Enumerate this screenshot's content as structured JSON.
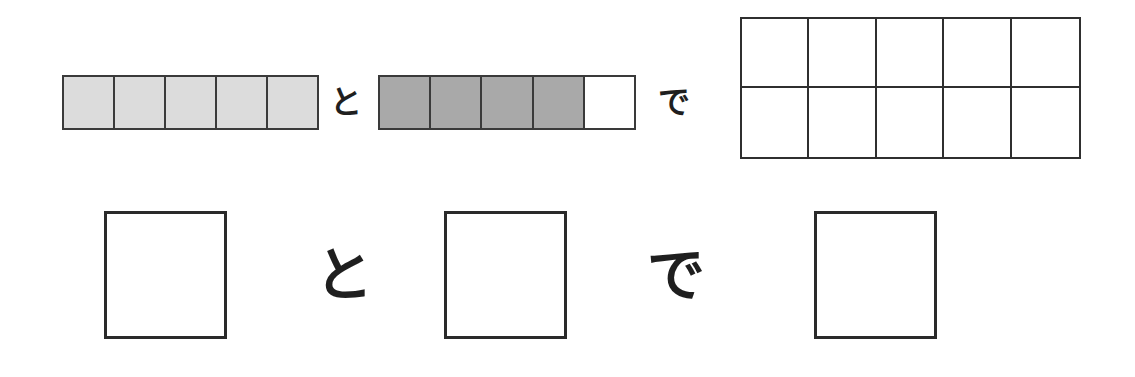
{
  "problem": {
    "bar_a": {
      "cells": 5,
      "filled": 5,
      "fill_color": "#dcdcdc"
    },
    "connector_to": "と",
    "bar_b": {
      "cells": 5,
      "filled": 4,
      "fill_color": "#a9a9a9",
      "empty_color": "#ffffff"
    },
    "connector_de": "で",
    "ten_frame": {
      "rows": 2,
      "cols": 5,
      "filled": 0
    }
  },
  "answer_row": {
    "box_1": "",
    "connector_to": "と",
    "box_2": "",
    "connector_de": "で",
    "box_3": ""
  },
  "colors": {
    "line": "#333333",
    "light_fill": "#dcdcdc",
    "dark_fill": "#a9a9a9"
  }
}
